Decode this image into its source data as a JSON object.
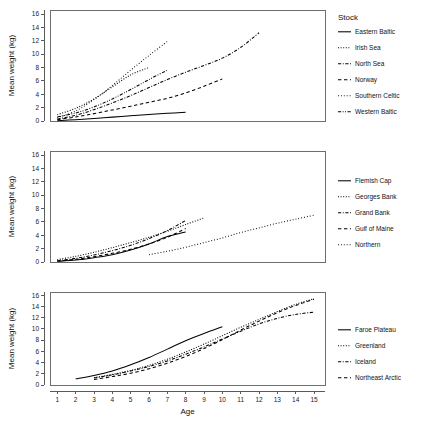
{
  "figure": {
    "axis_y_label": "Mean weight (kg)",
    "axis_x_label": "Age",
    "legend_title": "Stock",
    "x_ticks": [
      1,
      2,
      3,
      4,
      5,
      6,
      7,
      8,
      9,
      10,
      11,
      12,
      13,
      14,
      15
    ],
    "y_ticks": [
      0,
      2,
      4,
      6,
      8,
      10,
      12,
      14,
      16
    ],
    "line_color": "#000000",
    "frame_color": "#6e6e6e"
  },
  "chart_data": [
    {
      "type": "line",
      "title": "",
      "xlabel": "",
      "ylabel": "Mean weight (kg)",
      "xlim": [
        0.6,
        15.6
      ],
      "ylim": [
        0,
        16.6
      ],
      "grid": false,
      "legend_title": "Stock",
      "legend_position": "right",
      "series": [
        {
          "name": "Eastern Baltic",
          "dash": "solid",
          "x": [
            1,
            2,
            3,
            4,
            5,
            6,
            7,
            8
          ],
          "values": [
            0.05,
            0.2,
            0.38,
            0.58,
            0.78,
            0.97,
            1.15,
            1.3
          ]
        },
        {
          "name": "Irish Sea",
          "dash": "fine-dotted",
          "x": [
            1,
            2,
            3,
            4,
            5,
            6
          ],
          "values": [
            0.95,
            1.9,
            3.3,
            5.1,
            6.9,
            8.0
          ]
        },
        {
          "name": "North Sea",
          "dash": "dash-dot",
          "x": [
            1,
            2,
            3,
            4,
            5,
            6,
            7,
            8,
            9,
            10,
            11,
            12
          ],
          "values": [
            0.3,
            0.85,
            1.7,
            2.7,
            3.8,
            5.0,
            6.2,
            7.3,
            8.3,
            9.4,
            11.0,
            13.2
          ]
        },
        {
          "name": "Norway",
          "dash": "dashed",
          "x": [
            1,
            2,
            3,
            4,
            5,
            6,
            7,
            8,
            9,
            10
          ],
          "values": [
            0.2,
            0.6,
            1.1,
            1.65,
            2.2,
            2.8,
            3.4,
            4.2,
            5.2,
            6.3
          ]
        },
        {
          "name": "Southern Celtic",
          "dash": "dotted",
          "x": [
            1,
            2,
            3,
            4,
            5,
            6,
            7
          ],
          "values": [
            0.5,
            1.5,
            3.2,
            5.3,
            7.6,
            9.8,
            11.9
          ]
        },
        {
          "name": "Western Baltic",
          "dash": "dash-dot-dot",
          "x": [
            1,
            2,
            3,
            4,
            5,
            6,
            7
          ],
          "values": [
            0.6,
            1.2,
            2.1,
            3.3,
            4.7,
            6.2,
            7.6
          ]
        }
      ]
    },
    {
      "type": "line",
      "title": "",
      "xlabel": "",
      "ylabel": "Mean weight (kg)",
      "xlim": [
        0.6,
        15.6
      ],
      "ylim": [
        0,
        16.6
      ],
      "grid": false,
      "legend_title": "",
      "legend_position": "right",
      "series": [
        {
          "name": "Flemish Cap",
          "dash": "solid",
          "x": [
            1,
            2,
            3,
            4,
            5,
            6,
            7,
            8
          ],
          "values": [
            0.1,
            0.3,
            0.65,
            1.1,
            1.8,
            2.7,
            3.8,
            4.5
          ]
        },
        {
          "name": "Georges Bank",
          "dash": "fine-dotted",
          "x": [
            1,
            2,
            3,
            4,
            5,
            6,
            7,
            8,
            9
          ],
          "values": [
            0.35,
            0.85,
            1.45,
            2.15,
            2.9,
            3.7,
            4.6,
            5.6,
            6.6
          ]
        },
        {
          "name": "Grand Bank",
          "dash": "dash-dot",
          "x": [
            1,
            2,
            3,
            4,
            5,
            6,
            7,
            8
          ],
          "values": [
            0.2,
            0.55,
            1.05,
            1.7,
            2.5,
            3.5,
            4.7,
            6.2
          ]
        },
        {
          "name": "Gulf of Maine",
          "dash": "dashed",
          "x": [
            1,
            2,
            3,
            4,
            5,
            6,
            7,
            8
          ],
          "values": [
            0.15,
            0.4,
            0.8,
            1.3,
            1.9,
            2.7,
            3.7,
            5.0
          ]
        },
        {
          "name": "Northern",
          "dash": "dotted",
          "x": [
            6,
            7,
            8,
            9,
            10,
            11,
            12,
            13,
            14,
            15
          ],
          "values": [
            1.1,
            1.6,
            2.2,
            2.9,
            3.6,
            4.4,
            5.1,
            5.8,
            6.4,
            7.0
          ]
        }
      ]
    },
    {
      "type": "line",
      "title": "",
      "xlabel": "Age",
      "ylabel": "Mean weight (kg)",
      "xlim": [
        0.6,
        15.6
      ],
      "ylim": [
        0,
        16.6
      ],
      "grid": false,
      "legend_title": "",
      "legend_position": "right",
      "series": [
        {
          "name": "Faroe Plateau",
          "dash": "solid",
          "x": [
            2,
            3,
            4,
            5,
            6,
            7,
            8,
            9,
            10
          ],
          "values": [
            1.1,
            1.7,
            2.5,
            3.6,
            4.9,
            6.4,
            7.9,
            9.2,
            10.4
          ]
        },
        {
          "name": "Greenland",
          "dash": "fine-dotted",
          "x": [
            3,
            4,
            5,
            6,
            7,
            8,
            9,
            10,
            11,
            12,
            13,
            14,
            15
          ],
          "values": [
            1.3,
            1.9,
            2.6,
            3.5,
            4.6,
            5.9,
            7.3,
            8.8,
            10.3,
            11.7,
            13.1,
            14.4,
            15.4
          ]
        },
        {
          "name": "Iceland",
          "dash": "dash-dot",
          "x": [
            3,
            4,
            5,
            6,
            7,
            8,
            9,
            10,
            11,
            12,
            13,
            14,
            15
          ],
          "values": [
            1.25,
            1.8,
            2.5,
            3.3,
            4.3,
            5.5,
            6.8,
            8.2,
            9.6,
            10.9,
            11.9,
            12.6,
            13.0
          ]
        },
        {
          "name": "Northeast Arctic",
          "dash": "dashed",
          "x": [
            3,
            4,
            5,
            6,
            7,
            8,
            9,
            10,
            11,
            12,
            13,
            14,
            15
          ],
          "values": [
            1.0,
            1.5,
            2.1,
            2.9,
            3.9,
            5.1,
            6.5,
            8.1,
            9.8,
            11.4,
            12.9,
            14.2,
            15.3
          ]
        }
      ]
    }
  ]
}
